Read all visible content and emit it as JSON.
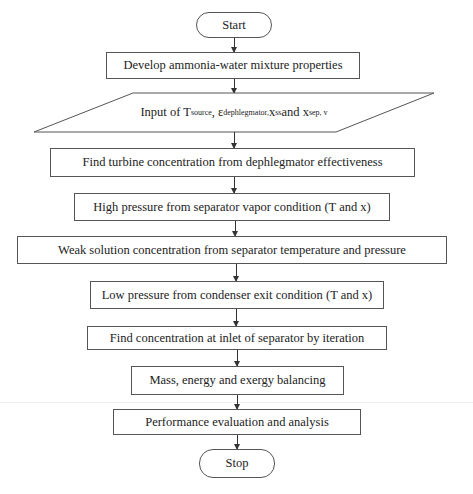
{
  "flowchart": {
    "start": "Start",
    "steps": [
      "Develop ammonia-water mixture properties",
      "Find turbine concentration from dephlegmator effectiveness",
      "High pressure from separator vapor condition (T and x)",
      "Weak solution concentration from separator temperature and pressure",
      "Low pressure from condenser exit condition (T and x)",
      "Find concentration at inlet of separator by iteration",
      "Mass, energy and exergy balancing",
      "Performance evaluation and analysis"
    ],
    "input": {
      "prefix": "Input of T",
      "t_sub": "source",
      "sep1": ", ε",
      "eps_sub": "dephlegmator,",
      "sep2": " x",
      "xss_sub": "ss",
      "sep3": " and x",
      "xsep_sub": "sep, v"
    },
    "stop": "Stop"
  }
}
